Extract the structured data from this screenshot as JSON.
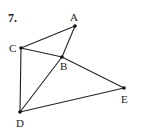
{
  "problem_number": "7.",
  "points": {
    "A": {
      "label": "A",
      "x": 75,
      "y": 26
    },
    "B": {
      "label": "B",
      "x": 62,
      "y": 57
    },
    "C": {
      "label": "C",
      "x": 21,
      "y": 48
    },
    "D": {
      "label": "D",
      "x": 20,
      "y": 112
    },
    "E": {
      "label": "E",
      "x": 124,
      "y": 88
    }
  },
  "segments": [
    [
      "C",
      "A"
    ],
    [
      "A",
      "B"
    ],
    [
      "B",
      "D"
    ],
    [
      "C",
      "B"
    ],
    [
      "B",
      "E"
    ],
    [
      "C",
      "D"
    ],
    [
      "D",
      "E"
    ]
  ],
  "colors": {
    "stroke": "#222222",
    "background": "#ffffff"
  }
}
